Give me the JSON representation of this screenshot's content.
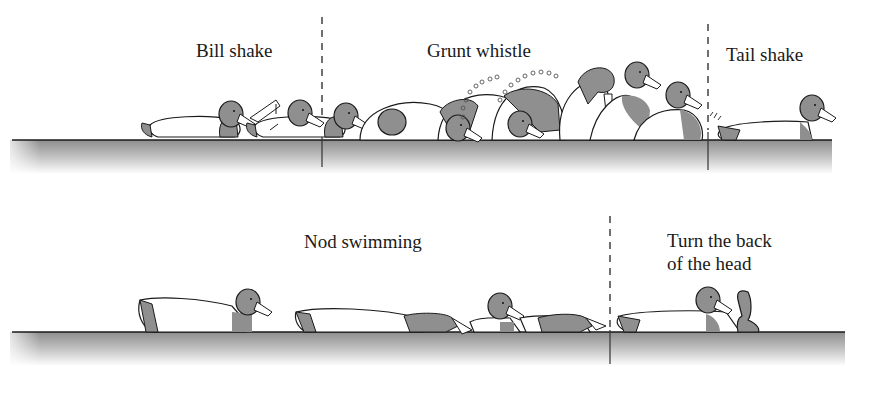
{
  "figure": {
    "rows": [
      {
        "id": "top-row",
        "sections": [
          {
            "label": "Bill shake"
          },
          {
            "label": "Grunt whistle"
          },
          {
            "label": "Tail shake"
          }
        ]
      },
      {
        "id": "bottom-row",
        "sections": [
          {
            "label": "Nod swimming"
          },
          {
            "label_line1": "Turn the back",
            "label_line2": "of the head"
          }
        ]
      }
    ],
    "colors": {
      "head_fill": "#8f8f8f",
      "body_fill": "#ffffff",
      "outline": "#1a1a1a",
      "water_top": "#9a9a9a",
      "water_bottom": "#ffffff"
    }
  }
}
